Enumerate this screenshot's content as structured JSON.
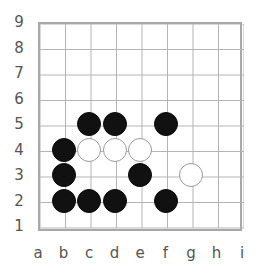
{
  "figure": {
    "background_color": "#ffffff"
  },
  "board": {
    "size": 9,
    "grid_color": "#b4b4b4",
    "border_color": "#a8a8a8",
    "label_color": "#555555",
    "origin_x": 38,
    "origin_y": 22,
    "cell": 25.5,
    "stone_radius": 12,
    "file_labels": [
      "a",
      "b",
      "c",
      "d",
      "e",
      "f",
      "g",
      "h",
      "i"
    ],
    "rank_labels": [
      "9",
      "8",
      "7",
      "6",
      "5",
      "4",
      "3",
      "2",
      "1"
    ]
  },
  "chart_data": {
    "type": "scatter",
    "xlabel": "",
    "ylabel": "",
    "x": [
      "a",
      "b",
      "c",
      "d",
      "e",
      "f",
      "g",
      "h",
      "i"
    ],
    "xlim": [
      1,
      9
    ],
    "ylim": [
      1,
      9
    ],
    "grid": true,
    "legend": "none",
    "series": [
      {
        "name": "black",
        "color": "#111111",
        "points": [
          {
            "file": "c",
            "rank": 5
          },
          {
            "file": "d",
            "rank": 5
          },
          {
            "file": "f",
            "rank": 5
          },
          {
            "file": "b",
            "rank": 4
          },
          {
            "file": "b",
            "rank": 3
          },
          {
            "file": "e",
            "rank": 3
          },
          {
            "file": "b",
            "rank": 2
          },
          {
            "file": "c",
            "rank": 2
          },
          {
            "file": "d",
            "rank": 2
          },
          {
            "file": "f",
            "rank": 2
          }
        ]
      },
      {
        "name": "white",
        "color": "#ffffff",
        "points": [
          {
            "file": "c",
            "rank": 4
          },
          {
            "file": "d",
            "rank": 4
          },
          {
            "file": "e",
            "rank": 4
          },
          {
            "file": "g",
            "rank": 3
          }
        ]
      }
    ]
  }
}
